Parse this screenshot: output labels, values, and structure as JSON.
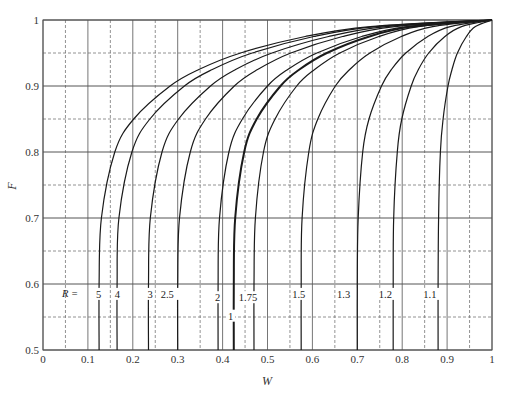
{
  "chart_data": {
    "type": "line",
    "title": "",
    "xlabel": "W",
    "ylabel": "F",
    "xlim": [
      0,
      1
    ],
    "ylim": [
      0.5,
      1
    ],
    "grid": true,
    "x_ticks": [
      "0",
      "0.1",
      "0.2",
      "0.3",
      "0.4",
      "0.5",
      "0.6",
      "0.7",
      "0.8",
      "0.9",
      "1"
    ],
    "y_ticks": [
      "0.5",
      "0.6",
      "0.7",
      "0.8",
      "0.9",
      "1"
    ],
    "legend_prefix": "R =",
    "F_points": [
      0.5,
      0.6,
      0.7,
      0.8,
      0.85,
      0.9,
      0.925,
      0.95,
      0.975,
      0.99,
      1.0
    ],
    "series": [
      {
        "name": "5",
        "bold": false,
        "label_w": 0.118,
        "label_f": 0.585,
        "W": [
          0.125,
          0.125,
          0.13,
          0.16,
          0.202,
          0.283,
          0.347,
          0.44,
          0.584,
          0.729,
          1.0
        ]
      },
      {
        "name": "4",
        "bold": false,
        "label_w": 0.16,
        "label_f": 0.585,
        "W": [
          0.165,
          0.165,
          0.169,
          0.198,
          0.238,
          0.315,
          0.377,
          0.466,
          0.603,
          0.741,
          1.0
        ]
      },
      {
        "name": "3",
        "bold": false,
        "label_w": 0.233,
        "label_f": 0.585,
        "W": [
          0.235,
          0.235,
          0.239,
          0.265,
          0.302,
          0.373,
          0.429,
          0.51,
          0.636,
          0.763,
          1.0
        ]
      },
      {
        "name": "2.5",
        "bold": false,
        "label_w": 0.262,
        "label_f": 0.585,
        "W": [
          0.3,
          0.3,
          0.304,
          0.328,
          0.362,
          0.426,
          0.478,
          0.552,
          0.667,
          0.783,
          1.0
        ]
      },
      {
        "name": "2",
        "bold": false,
        "label_w": 0.383,
        "label_f": 0.58,
        "W": [
          0.39,
          0.39,
          0.393,
          0.414,
          0.444,
          0.5,
          0.545,
          0.61,
          0.71,
          0.811,
          1.0
        ]
      },
      {
        "name": "1",
        "bold": true,
        "label_w": 0.412,
        "label_f": 0.552,
        "W": [
          0.425,
          0.425,
          0.428,
          0.448,
          0.476,
          0.529,
          0.571,
          0.632,
          0.727,
          0.822,
          1.0
        ]
      },
      {
        "name": "1.75",
        "bold": false,
        "label_w": 0.436,
        "label_f": 0.58,
        "W": [
          0.47,
          0.47,
          0.473,
          0.491,
          0.517,
          0.565,
          0.605,
          0.661,
          0.748,
          0.836,
          1.0
        ]
      },
      {
        "name": "1.5",
        "bold": false,
        "label_w": 0.555,
        "label_f": 0.585,
        "W": [
          0.575,
          0.575,
          0.577,
          0.592,
          0.612,
          0.651,
          0.683,
          0.728,
          0.798,
          0.868,
          1.0
        ]
      },
      {
        "name": "1.3",
        "bold": false,
        "label_w": 0.655,
        "label_f": 0.585,
        "W": [
          0.7,
          0.7,
          0.702,
          0.712,
          0.726,
          0.754,
          0.776,
          0.808,
          0.857,
          0.907,
          1.0
        ]
      },
      {
        "name": "1.2",
        "bold": false,
        "label_w": 0.748,
        "label_f": 0.585,
        "W": [
          0.78,
          0.78,
          0.781,
          0.789,
          0.799,
          0.82,
          0.836,
          0.859,
          0.895,
          0.932,
          1.0
        ]
      },
      {
        "name": "1.1",
        "bold": false,
        "label_w": 0.847,
        "label_f": 0.585,
        "W": [
          0.88,
          0.88,
          0.881,
          0.885,
          0.891,
          0.902,
          0.911,
          0.923,
          0.943,
          0.963,
          1.0
        ]
      }
    ]
  }
}
